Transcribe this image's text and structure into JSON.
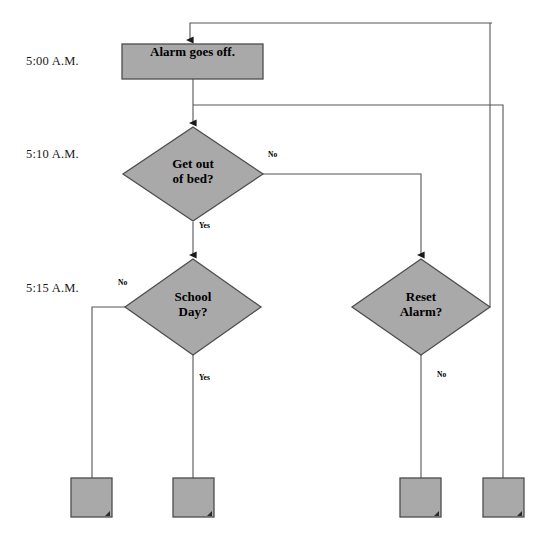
{
  "diagram": {
    "background_color": "#ffffff",
    "shape_fill_color": "#aaa9aa",
    "shape_stroke_color": "#4d4d4d",
    "connector_color": "#555555",
    "text_color": "#000000"
  },
  "timeline": {
    "labels": [
      {
        "text": "5:00 A.M.",
        "x": 26,
        "y": 54
      },
      {
        "text": "5:10 A.M.",
        "x": 26,
        "y": 147
      },
      {
        "text": "5:15 A.M.",
        "x": 26,
        "y": 281
      }
    ]
  },
  "nodes": [
    {
      "id": "alarm-goes-off",
      "type": "process",
      "label": "Alarm goes off.",
      "x": 122,
      "y": 44,
      "width": 141,
      "height": 35
    },
    {
      "id": "get-out-of-bed",
      "type": "decision",
      "label": "Get out\nof bed?",
      "cx": 193,
      "cy": 174,
      "rx": 70,
      "ry": 47
    },
    {
      "id": "school-day",
      "type": "decision",
      "label": "School\nDay?",
      "cx": 193,
      "cy": 307,
      "rx": 68,
      "ry": 48
    },
    {
      "id": "reset-alarm",
      "type": "decision",
      "label": "Reset\nAlarm?",
      "cx": 421,
      "cy": 307,
      "rx": 69,
      "ry": 48
    },
    {
      "id": "terminal-1",
      "type": "process",
      "label": "",
      "x": 71,
      "y": 478,
      "width": 41,
      "height": 39
    },
    {
      "id": "terminal-2",
      "type": "process",
      "label": "",
      "x": 173,
      "y": 478,
      "width": 41,
      "height": 39
    },
    {
      "id": "terminal-3",
      "type": "process",
      "label": "",
      "x": 400,
      "y": 478,
      "width": 41,
      "height": 39
    },
    {
      "id": "terminal-4",
      "type": "process",
      "label": "",
      "x": 483,
      "y": 478,
      "width": 41,
      "height": 39
    }
  ],
  "edge_labels": [
    {
      "id": "bed-no",
      "text": "No",
      "x": 268,
      "y": 150
    },
    {
      "id": "bed-yes",
      "text": "Yes",
      "x": 199,
      "y": 221
    },
    {
      "id": "school-no",
      "text": "No",
      "x": 118,
      "y": 278
    },
    {
      "id": "school-yes",
      "text": "Yes",
      "x": 199,
      "y": 373
    },
    {
      "id": "reset-no",
      "text": "No",
      "x": 437,
      "y": 370
    }
  ],
  "edges": [
    {
      "id": "entry-to-alarm",
      "from": "loop-top",
      "to": "alarm-goes-off",
      "path": "M 492 23 L 190 23 L 190 40",
      "arrow": true
    },
    {
      "id": "alarm-to-bed",
      "from": "alarm-goes-off",
      "to": "get-out-of-bed",
      "path": "M 193 79 L 193 123",
      "arrow": true
    },
    {
      "id": "bed-no-to-reset",
      "from": "get-out-of-bed",
      "to": "reset-alarm",
      "path": "M 263 174 L 421 174 L 421 255",
      "arrow": true
    },
    {
      "id": "bed-yes-to-school",
      "from": "get-out-of-bed",
      "to": "school-day",
      "path": "M 193 222 L 193 255",
      "arrow": true
    },
    {
      "id": "school-no-to-terminal1",
      "from": "school-day",
      "to": "terminal-1",
      "path": "M 125 307 L 92 307 L 92 478",
      "arrow": false
    },
    {
      "id": "school-yes-to-terminal2",
      "from": "school-day",
      "to": "terminal-2",
      "path": "M 193 355 L 193 478",
      "arrow": false
    },
    {
      "id": "reset-no-to-terminal3",
      "from": "reset-alarm",
      "to": "terminal-3",
      "path": "M 421 355 L 421 478",
      "arrow": false
    },
    {
      "id": "reset-yes-loop",
      "from": "reset-alarm",
      "to": "alarm-goes-off",
      "path": "M 490 307 L 490 23",
      "arrow": false
    },
    {
      "id": "alarm-branch-to-terminal4",
      "from": "alarm-goes-off",
      "to": "terminal-4",
      "path": "M 193 105 L 503 105 L 503 478",
      "arrow": false
    }
  ]
}
